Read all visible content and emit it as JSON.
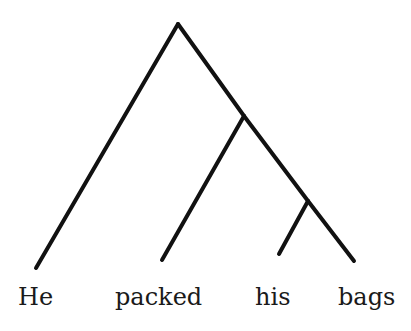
{
  "diagram": {
    "type": "syntax-tree",
    "words": [
      "He",
      "packed",
      "his",
      "bags"
    ],
    "line_color": "#111111",
    "line_width": 4,
    "nodes": {
      "root": {
        "x": 178,
        "y": 24
      },
      "vp": {
        "x": 244,
        "y": 116
      },
      "np": {
        "x": 308,
        "y": 201
      }
    },
    "leaves": {
      "he": {
        "x": 36,
        "y": 268
      },
      "packed": {
        "x": 162,
        "y": 260
      },
      "his": {
        "x": 279,
        "y": 254
      },
      "bags": {
        "x": 354,
        "y": 261
      }
    },
    "labels": [
      {
        "text": "He",
        "x": 18
      },
      {
        "text": "packed",
        "x": 115
      },
      {
        "text": "his",
        "x": 255
      },
      {
        "text": "bags",
        "x": 338
      }
    ]
  }
}
